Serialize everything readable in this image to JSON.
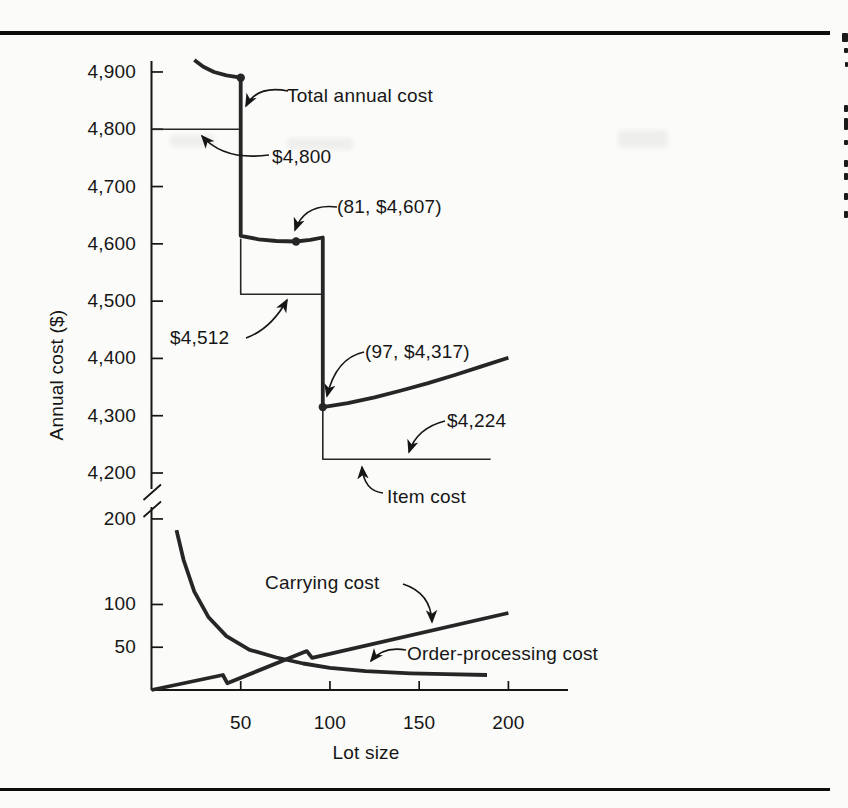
{
  "figure": {
    "y_axis_label": "Annual cost ($)",
    "x_axis_label": "Lot size",
    "annotations": {
      "total_annual_cost": "Total annual cost",
      "price_4800": "$4,800",
      "point_81": "(81, $4,607)",
      "price_4512": "$4,512",
      "point_97": "(97, $4,317)",
      "price_4224": "$4,224",
      "item_cost": "Item cost",
      "carrying_cost": "Carrying cost",
      "order_processing_cost": "Order-processing cost"
    }
  },
  "chart_data": {
    "type": "line",
    "title": "",
    "xlabel": "Lot size",
    "ylabel": "Annual cost ($)",
    "x_ticks": [
      50,
      100,
      150,
      200
    ],
    "y_axis_upper": {
      "ticks": [
        4200,
        4300,
        4400,
        4500,
        4600,
        4700,
        4800,
        4900
      ],
      "tick_labels": [
        "4,200",
        "4,300",
        "4,400",
        "4,500",
        "4,600",
        "4,700",
        "4,800",
        "4,900"
      ]
    },
    "y_axis_lower": {
      "ticks": [
        50,
        100,
        200
      ],
      "tick_labels": [
        "50",
        "100",
        "200"
      ]
    },
    "axis_break": true,
    "x_tick_labels": [
      "50",
      "100",
      "150",
      "200"
    ],
    "series": [
      {
        "name": "Total annual cost",
        "scale": "upper",
        "style": "thick",
        "segments": [
          [
            [
              24,
              4921
            ],
            [
              29,
              4909
            ],
            [
              35,
              4900
            ],
            [
              42,
              4894
            ],
            [
              50,
              4890
            ],
            [
              50,
              4614
            ],
            [
              60,
              4608
            ],
            [
              70,
              4605
            ],
            [
              81,
              4604
            ],
            [
              89,
              4607
            ],
            [
              96,
              4611
            ],
            [
              96,
              4315
            ],
            [
              110,
              4322
            ],
            [
              125,
              4332
            ],
            [
              140,
              4344
            ],
            [
              155,
              4357
            ],
            [
              170,
              4371
            ],
            [
              185,
              4386
            ],
            [
              200,
              4401
            ]
          ]
        ]
      },
      {
        "name": "Item cost",
        "scale": "upper",
        "style": "thin",
        "segments": [
          [
            [
              0,
              4800
            ],
            [
              50,
              4800
            ]
          ],
          [
            [
              50,
              4609
            ],
            [
              50,
              4512
            ],
            [
              96,
              4512
            ]
          ],
          [
            [
              96,
              4318
            ],
            [
              96,
              4224
            ],
            [
              190,
              4224
            ]
          ]
        ]
      },
      {
        "name": "Carrying cost",
        "scale": "lower",
        "style": "thick",
        "segments": [
          [
            [
              0,
              0
            ],
            [
              40,
              17.5
            ],
            [
              42.5,
              8
            ],
            [
              87,
              45.5
            ],
            [
              90,
              37.5
            ],
            [
              200,
              90
            ]
          ]
        ]
      },
      {
        "name": "Order-processing cost",
        "scale": "lower",
        "style": "thick",
        "segments": [
          [
            [
              14,
              187
            ],
            [
              18,
              152
            ],
            [
              24,
              115
            ],
            [
              32,
              85
            ],
            [
              42,
              63
            ],
            [
              55,
              47
            ],
            [
              70,
              38
            ],
            [
              85,
              31
            ],
            [
              100,
              26
            ],
            [
              120,
              22
            ],
            [
              145,
              19.5
            ],
            [
              165,
              18.5
            ],
            [
              188,
              17.5
            ]
          ]
        ]
      }
    ],
    "key_points": [
      {
        "lot": 50,
        "cost": 4890,
        "label": ""
      },
      {
        "lot": 81,
        "cost": 4604,
        "label": "(81, $4,607)"
      },
      {
        "lot": 96,
        "cost": 4315,
        "label": "(97, $4,317)"
      }
    ],
    "step_price_levels": [
      {
        "label": "$4,800",
        "value": 4800,
        "lot_range": [
          0,
          50
        ]
      },
      {
        "label": "$4,512",
        "value": 4512,
        "lot_range": [
          50,
          97
        ]
      },
      {
        "label": "$4,224",
        "value": 4224,
        "lot_range": [
          97,
          190
        ]
      }
    ],
    "legend_position": "none",
    "grid": false
  },
  "colors": {
    "ink": "#161616",
    "curve": "#262626",
    "background": "#fbfbf9",
    "rule": "#0d0d0d"
  }
}
